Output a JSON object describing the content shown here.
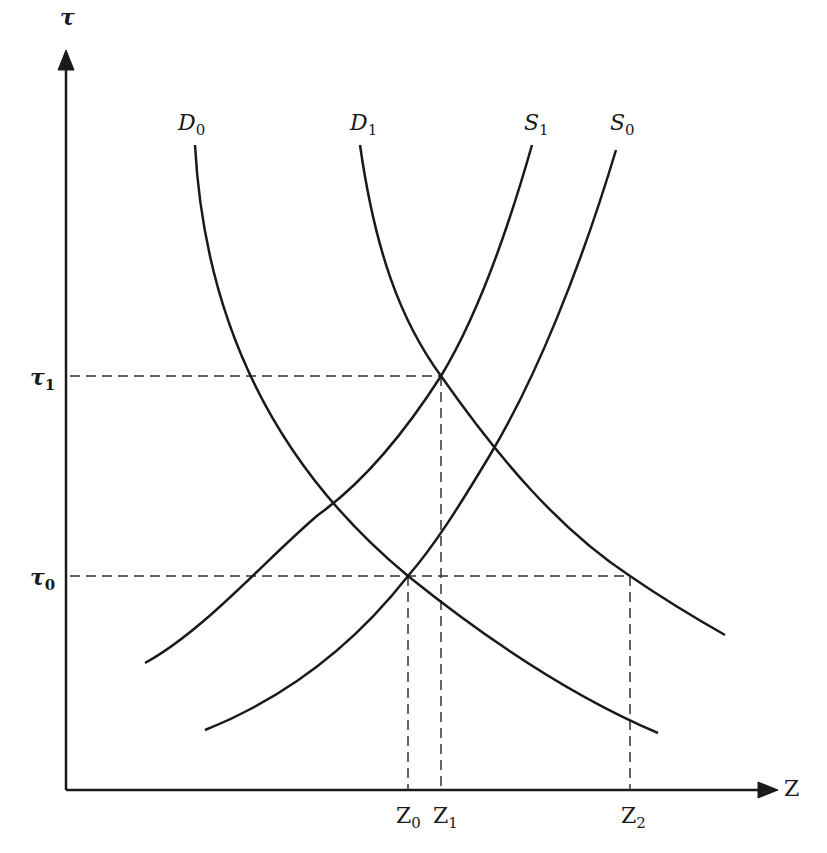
{
  "diagram": {
    "type": "supply-demand-shift",
    "axes": {
      "y_label": "τ",
      "x_label": "Z"
    },
    "curves": [
      {
        "id": "D0",
        "name": "D",
        "sub": "0",
        "kind": "demand"
      },
      {
        "id": "D1",
        "name": "D",
        "sub": "1",
        "kind": "demand"
      },
      {
        "id": "S1",
        "name": "S",
        "sub": "1",
        "kind": "supply"
      },
      {
        "id": "S0",
        "name": "S",
        "sub": "0",
        "kind": "supply"
      }
    ],
    "y_ticks": [
      {
        "name": "τ",
        "sub": "1"
      },
      {
        "name": "τ",
        "sub": "0"
      }
    ],
    "x_ticks": [
      {
        "name": "Z",
        "sub": "0"
      },
      {
        "name": "Z",
        "sub": "1"
      },
      {
        "name": "Z",
        "sub": "2"
      }
    ],
    "equilibria": [
      {
        "label": "D0∩S0",
        "x": "Z0",
        "y": "τ0"
      },
      {
        "label": "D1∩S1",
        "x": "Z1",
        "y": "τ1"
      },
      {
        "label": "D1 at τ0",
        "x": "Z2",
        "y": "τ0"
      }
    ],
    "colors": {
      "line": "#1a1a1a",
      "background": "#ffffff"
    }
  }
}
